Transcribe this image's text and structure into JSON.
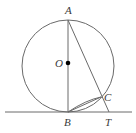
{
  "diagram": {
    "type": "geometry",
    "circle": {
      "center": "O",
      "cx": 68,
      "cy": 66,
      "r": 46
    },
    "points": {
      "A": {
        "label": "A",
        "x": 68,
        "y": 20
      },
      "O": {
        "label": "O",
        "x": 68,
        "y": 63
      },
      "B": {
        "label": "B",
        "x": 68,
        "y": 112
      },
      "C": {
        "label": "C",
        "x": 101,
        "y": 97
      },
      "T": {
        "label": "T",
        "x": 109,
        "y": 112
      }
    },
    "segments": [
      "AB",
      "AT",
      "BC"
    ],
    "tangent_line": {
      "through": "B",
      "x1": 5,
      "x2": 132,
      "y": 112
    },
    "colors": {
      "stroke": "#6a6a6a",
      "text": "#3a3a3a",
      "dot": "#000000"
    }
  }
}
